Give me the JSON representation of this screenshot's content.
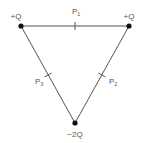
{
  "diagram": {
    "title": "",
    "type": "equilateral triangle charge arrangement",
    "colors": {
      "line": "#555555",
      "charge": "#111111",
      "text": "#555555",
      "background": "#ffffff"
    },
    "charges": [
      {
        "id": "top-left",
        "label": "+Q",
        "x": 21,
        "y": 26,
        "label_x": 16,
        "label_y": 19
      },
      {
        "id": "top-right",
        "label": "+Q",
        "x": 129,
        "y": 26,
        "label_x": 129,
        "label_y": 19
      },
      {
        "id": "bottom",
        "label": "−2Q",
        "x": 75,
        "y": 123,
        "label_x": 75,
        "label_y": 137
      }
    ],
    "points": [
      {
        "id": "p1",
        "base": "P",
        "sub": "1",
        "on_side": "top",
        "x": 75,
        "y": 26
      },
      {
        "id": "p2",
        "base": "P",
        "sub": "2",
        "on_side": "right",
        "x": 102,
        "y": 75
      },
      {
        "id": "p3",
        "base": "P",
        "sub": "3",
        "on_side": "left",
        "x": 48,
        "y": 75
      }
    ]
  }
}
